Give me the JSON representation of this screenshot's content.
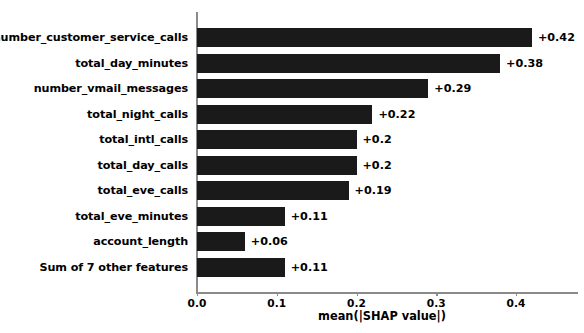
{
  "chart_data": {
    "type": "bar",
    "orientation": "horizontal",
    "title": "",
    "xlabel": "mean(|SHAP value|)",
    "ylabel": "",
    "xlim": [
      0.0,
      0.4768
    ],
    "grid": false,
    "legend": null,
    "bar_color": "#1a1a1a",
    "axis_color": "#8a8a8a",
    "categories": [
      "number_customer_service_calls",
      "total_day_minutes",
      "number_vmail_messages",
      "total_night_calls",
      "total_intl_calls",
      "total_day_calls",
      "total_eve_calls",
      "total_eve_minutes",
      "account_length",
      "Sum of 7 other features"
    ],
    "values": [
      0.42,
      0.38,
      0.29,
      0.22,
      0.2,
      0.2,
      0.19,
      0.11,
      0.06,
      0.11
    ],
    "value_labels": [
      "+0.42",
      "+0.38",
      "+0.29",
      "+0.22",
      "+0.2",
      "+0.2",
      "+0.19",
      "+0.11",
      "+0.06",
      "+0.11"
    ],
    "xticks": [
      0.0,
      0.1,
      0.2,
      0.3,
      0.4
    ],
    "xtick_labels": [
      "0.0",
      "0.1",
      "0.2",
      "0.3",
      "0.4"
    ]
  }
}
